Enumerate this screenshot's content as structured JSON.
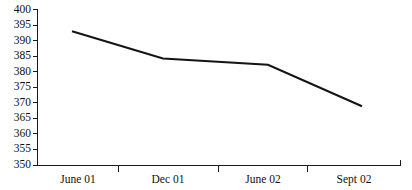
{
  "chart_data": {
    "type": "line",
    "title": "",
    "subtitle": "",
    "xlabel": "",
    "ylabel": "",
    "x": [
      "June 01",
      "Dec 01",
      "June 02",
      "Sept 02"
    ],
    "categories": [
      "June 01",
      "Dec 01",
      "June 02",
      "Sept 02"
    ],
    "values": [
      393,
      384.3,
      382.3,
      369
    ],
    "series": [
      {
        "name": "",
        "values": [
          393,
          384.3,
          382.3,
          369
        ]
      }
    ],
    "ylim": [
      350,
      400
    ],
    "ytick_step": 5,
    "ytick_labels": [
      "350",
      "355",
      "360",
      "365",
      "370",
      "375",
      "380",
      "385",
      "390",
      "395",
      "400"
    ],
    "ytick_values": [
      350,
      355,
      360,
      365,
      370,
      375,
      380,
      385,
      390,
      395,
      400
    ],
    "xtick_labels": [
      "June 01",
      "Dec 01",
      "June 02",
      "Sept 02"
    ],
    "grid": false,
    "legend": false,
    "legend_position": "none",
    "line_color": "#141414",
    "axis_color": "#1a1a1a",
    "background_color": "#ffffff",
    "annotations": []
  },
  "axes": {
    "y_labels": [
      {
        "text": "400",
        "value": 400
      },
      {
        "text": "395",
        "value": 395
      },
      {
        "text": "390",
        "value": 390
      },
      {
        "text": "385",
        "value": 385
      },
      {
        "text": "380",
        "value": 380
      },
      {
        "text": "375",
        "value": 375
      },
      {
        "text": "370",
        "value": 370
      },
      {
        "text": "365",
        "value": 365
      },
      {
        "text": "360",
        "value": 360
      },
      {
        "text": "355",
        "value": 355
      },
      {
        "text": "350",
        "value": 350
      }
    ],
    "x_labels": [
      {
        "text": "June 01"
      },
      {
        "text": "Dec 01"
      },
      {
        "text": "June 02"
      },
      {
        "text": "Sept 02"
      }
    ]
  }
}
